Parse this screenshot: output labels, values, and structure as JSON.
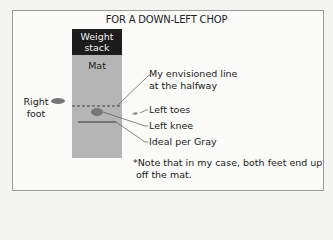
{
  "title": "FOR A DOWN-LEFT CHOP",
  "weight_stack": {
    "line1": "Weight",
    "line2": "stack"
  },
  "mat": {
    "label": "Mat"
  },
  "right_foot": {
    "line1": "Right",
    "line2": "foot"
  },
  "callouts": {
    "envisioned_line": {
      "line1": "My envisioned line",
      "line2": "at the halfway"
    },
    "left_toes": "Left toes",
    "left_knee": "Left knee",
    "ideal": "Ideal per Gray"
  },
  "note": {
    "line1": "*Note that in my case, both feet end up",
    "line2": "off the mat."
  },
  "colors": {
    "stack": "#1c1c1c",
    "mat": "#b5b5b5",
    "marker": "#777777"
  }
}
